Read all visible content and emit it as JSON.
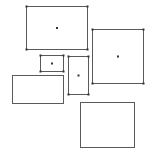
{
  "canvas": {
    "width": 150,
    "height": 155,
    "background": "#ffffff"
  },
  "style": {
    "stroke": "#5a5a5a",
    "handle_fill": "#333333",
    "center_fill": "#333333"
  },
  "rectangles": [
    {
      "id": "rect-1",
      "x": 26,
      "y": 6,
      "w": 61,
      "h": 43,
      "handles": true,
      "center": true
    },
    {
      "id": "rect-2",
      "x": 92,
      "y": 29,
      "w": 51,
      "h": 54,
      "handles": true,
      "center": true
    },
    {
      "id": "rect-3",
      "x": 40,
      "y": 55,
      "w": 23,
      "h": 16,
      "handles": true,
      "center": true
    },
    {
      "id": "rect-4",
      "x": 68,
      "y": 56,
      "w": 20,
      "h": 38,
      "handles": true,
      "center": true
    },
    {
      "id": "rect-5",
      "x": 12,
      "y": 75,
      "w": 51,
      "h": 28,
      "handles": false,
      "center": false
    },
    {
      "id": "rect-6",
      "x": 80,
      "y": 102,
      "w": 54,
      "h": 45,
      "handles": false,
      "center": false
    }
  ]
}
